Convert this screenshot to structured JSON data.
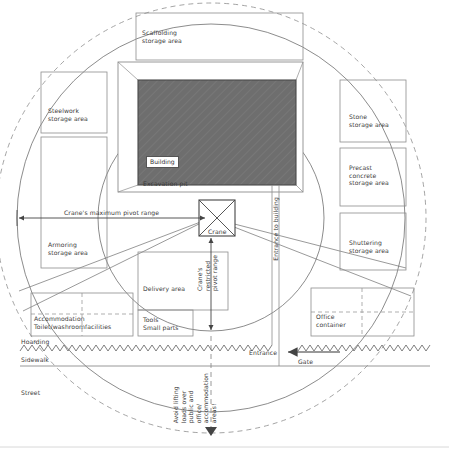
{
  "diagram": {
    "colors": {
      "building_fill": "#6e6e6e",
      "line": "#555555",
      "text": "#3a3a3a",
      "thin_line": "#8d8d8d"
    },
    "storage_areas": {
      "scaffolding": "Scaffolding\nstorage area",
      "steelwork": "Steelwork\nstorage area",
      "armoring": "Armoring\nstorage area",
      "stone": "Stone\nstorage area",
      "precast": "Precast\nconcrete\nstorage area",
      "shuttering": "Shuttering\nstorage area"
    },
    "site_features": {
      "building": "Building",
      "excavation_pit": "Excavation pit",
      "crane": "Crane",
      "delivery_area": "Delivery area",
      "tools": "Tools\nSmall parts",
      "accommodation": "Accommodation\nToilet/washroomfacilities",
      "office_container": "Office\ncontainer"
    },
    "annotations": {
      "max_pivot": "Crane's maximum pivot range",
      "restricted_pivot": "Crane's\nrestricted\npivot range",
      "entrance_to_building": "Entrance to building",
      "avoid_lifting": "Avoid lifting\nloads over\npublic and\noffice/\naccommodation\nareas!"
    },
    "street_side": {
      "hoarding": "Hoarding",
      "sidewalk": "Sidewalk",
      "street": "Street",
      "entrance": "Entrance",
      "gate": "Gate"
    }
  }
}
